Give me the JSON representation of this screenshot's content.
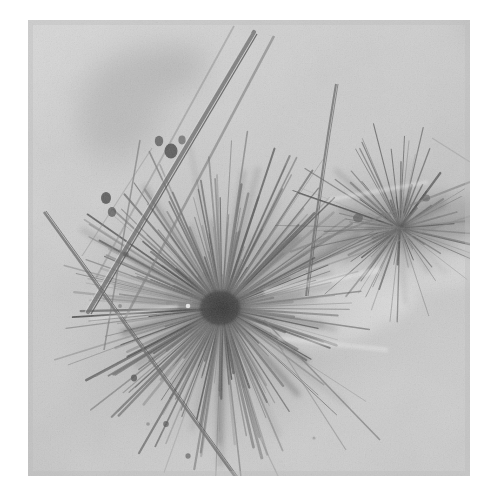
{
  "page": {
    "background_color": "#ffffff",
    "width": 482,
    "height": 494,
    "alt_text": "Brightfield photomicrograph of acicular (needle-like) crystals forming a radiating spherulitic aggregate"
  },
  "figure": {
    "name": "micrograph",
    "frame": {
      "x": 28,
      "y": 20,
      "width": 442,
      "height": 456
    },
    "modality": "brightfield-light-microscopy",
    "palette": {
      "background_light": "#d6d6d6",
      "background_mid": "#c7c7c7",
      "background_dark": "#bdbdbd",
      "needle_light": "#9a9a9a",
      "needle_mid": "#7a7a7a",
      "needle_dark": "#5a5a5a",
      "core_dark": "#3e3e3e",
      "highlight": "#ececec",
      "page_white": "#ffffff"
    },
    "content_summary": "Dense radiating cluster of thin acicular crystals (spherulite) centered left-of-middle, a second smaller radiating cluster at right, and several long isolated needles crossing the field diagonally.",
    "features": [
      {
        "id": "main-spherulite",
        "label": "central radiating crystal cluster",
        "center_x": 222,
        "center_y": 308,
        "radius": 150
      },
      {
        "id": "secondary-cluster",
        "label": "secondary radiating crystal cluster",
        "center_x": 398,
        "center_y": 228,
        "radius": 95
      },
      {
        "id": "long-needle-upper",
        "label": "long needle crossing upper field",
        "x1": 252,
        "y1": 36,
        "x2": 40,
        "y2": 300
      },
      {
        "id": "long-needle-vertical",
        "label": "thin near-vertical needle",
        "x1": 336,
        "y1": 84,
        "x2": 306,
        "y2": 292
      },
      {
        "id": "long-needle-lower",
        "label": "long needle to lower-left",
        "x1": 44,
        "y1": 212,
        "x2": 210,
        "y2": 478
      }
    ]
  },
  "chart_data": {
    "type": "scatter",
    "title": "",
    "xlabel": "",
    "ylabel": ""
  }
}
